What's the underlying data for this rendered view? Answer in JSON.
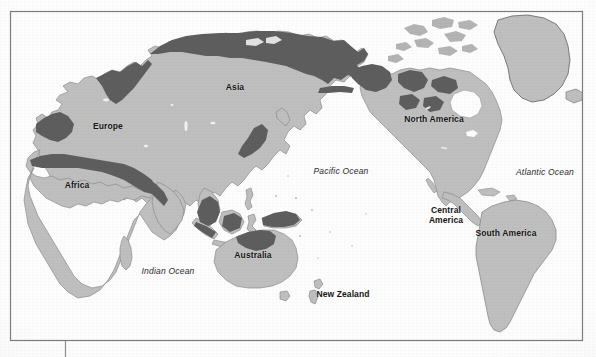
{
  "map": {
    "type": "world-map",
    "projection_center": "Pacific",
    "frame": {
      "left": 10,
      "top": 11,
      "right": 583,
      "bottom": 341
    },
    "colors": {
      "land": "#bfbfbf",
      "land_edge": "#8a8a8a",
      "highlight": "#5e5e5e",
      "ocean": "#fdfdfd",
      "frame_line": "#7d7d7d",
      "label_text": "#141414",
      "ocean_label_text": "#2a2a2a"
    },
    "continent_labels": [
      {
        "name": "asia",
        "text": "Asia",
        "x": 235,
        "y": 88
      },
      {
        "name": "europe",
        "text": "Europe",
        "x": 108,
        "y": 127
      },
      {
        "name": "africa",
        "text": "Africa",
        "x": 77,
        "y": 186
      },
      {
        "name": "australia",
        "text": "Australia",
        "x": 253,
        "y": 256
      },
      {
        "name": "new-zealand",
        "text": "New Zealand",
        "x": 343,
        "y": 295
      },
      {
        "name": "north-america",
        "text": "North America",
        "x": 434,
        "y": 120
      },
      {
        "name": "central-america",
        "text": "Central\nAmerica",
        "x": 446,
        "y": 216
      },
      {
        "name": "south-america",
        "text": "South America",
        "x": 506,
        "y": 234
      }
    ],
    "ocean_labels": [
      {
        "name": "pacific-ocean",
        "text": "Pacific Ocean",
        "x": 341,
        "y": 171
      },
      {
        "name": "atlantic-ocean",
        "text": "Atlantic Ocean",
        "x": 545,
        "y": 172
      },
      {
        "name": "indian-ocean",
        "text": "Indian Ocean",
        "x": 168,
        "y": 271
      }
    ]
  }
}
